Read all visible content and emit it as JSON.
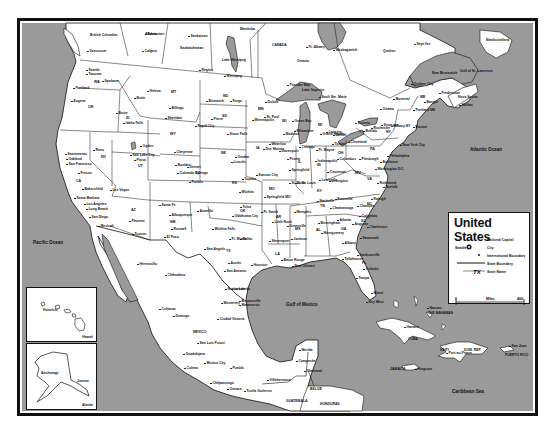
{
  "map": {
    "title": "United States",
    "colors": {
      "water": "#9a9a9a",
      "land": "#ffffff",
      "border": "#111111",
      "frame": "#111111"
    },
    "legend": {
      "title": "United States",
      "items": [
        {
          "symbol": "capital-star-icon",
          "label": "National Capital"
        },
        {
          "symbol": "city-dot-icon",
          "sample": "Seattle",
          "label": "City"
        },
        {
          "symbol": "international-boundary-line",
          "label": "International Boundary"
        },
        {
          "symbol": "state-boundary-line",
          "label": "State Boundary"
        },
        {
          "symbol": "state-abbr",
          "sample": "TX",
          "label": "State Name"
        }
      ],
      "scale": {
        "start": "0",
        "unit": "Miles",
        "end": "400"
      }
    },
    "water_labels": {
      "pacific": "Pacific Ocean",
      "atlantic": "Atlantic Ocean",
      "gulf": "Gulf of Mexico",
      "caribbean": "Caribbean Sea",
      "st_lawrence": "Gulf of St. Lawrence",
      "lake_winnipeg": "Lake Winnipeg",
      "lake_superior": "Lake Superior"
    },
    "insets": {
      "hawaii": {
        "caption": "Hawaii",
        "city": "Honolulu"
      },
      "alaska": {
        "caption": "Alaska",
        "cities": [
          "Anchorage",
          "Juneau"
        ]
      }
    },
    "regions": {
      "canada": "CANADA",
      "mexico": "MEXICO",
      "cuba": "CUBA",
      "haiti": "HAITI",
      "dom_rep": "DOM. REP.",
      "jamaica": "JAMAICA",
      "bahamas": "THE BAHAMAS",
      "puerto_rico": "PUERTO RICO",
      "belize": "BELIZE",
      "guatemala": "GUATEMALA",
      "honduras": "HONDURAS",
      "british_columbia": "British Columbia",
      "alberta": "Alberta",
      "saskatchewan": "Saskatchewan",
      "manitoba": "Manitoba",
      "ontario": "Ontario",
      "quebec": "Quebec",
      "newfoundland": "Newfoundland",
      "new_brunswick": "New Brunswick",
      "nova_scotia": "Nova Scotia"
    },
    "states": [
      "WA",
      "OR",
      "CA",
      "NV",
      "ID",
      "MT",
      "WY",
      "UT",
      "AZ",
      "NM",
      "CO",
      "ND",
      "SD",
      "NE",
      "KS",
      "OK",
      "TX",
      "MN",
      "IA",
      "MO",
      "AR",
      "LA",
      "WI",
      "IL",
      "MI",
      "IN",
      "OH",
      "KY",
      "TN",
      "MS",
      "AL",
      "GA",
      "FL",
      "SC",
      "NC",
      "VA",
      "WV",
      "PA",
      "NY",
      "ME"
    ],
    "cities": [
      {
        "name": "Vancouver",
        "x": 88,
        "y": 50
      },
      {
        "name": "Calgary",
        "x": 143,
        "y": 50
      },
      {
        "name": "Edmonton",
        "x": 146,
        "y": 33
      },
      {
        "name": "Saskatoon",
        "x": 189,
        "y": 35
      },
      {
        "name": "Regina",
        "x": 200,
        "y": 69
      },
      {
        "name": "Winnipeg",
        "x": 225,
        "y": 75
      },
      {
        "name": "Thunder Bay",
        "x": 288,
        "y": 84
      },
      {
        "name": "Ft. Albany",
        "x": 307,
        "y": 46
      },
      {
        "name": "Waskaganish",
        "x": 334,
        "y": 49
      },
      {
        "name": "Sept Iles",
        "x": 415,
        "y": 43
      },
      {
        "name": "Seattle",
        "x": 87,
        "y": 69
      },
      {
        "name": "Tacoma",
        "x": 87,
        "y": 73
      },
      {
        "name": "Spokane",
        "x": 103,
        "y": 80
      },
      {
        "name": "Portland",
        "x": 74,
        "y": 87
      },
      {
        "name": "Eugene",
        "x": 72,
        "y": 100
      },
      {
        "name": "Boise",
        "x": 117,
        "y": 112
      },
      {
        "name": "Idaho Falls",
        "x": 124,
        "y": 122
      },
      {
        "name": "Helena",
        "x": 148,
        "y": 90
      },
      {
        "name": "Butte",
        "x": 135,
        "y": 97
      },
      {
        "name": "Billings",
        "x": 170,
        "y": 107
      },
      {
        "name": "Sheridan",
        "x": 166,
        "y": 117
      },
      {
        "name": "Cheyenne",
        "x": 175,
        "y": 151
      },
      {
        "name": "Salt Lake City",
        "x": 131,
        "y": 154
      },
      {
        "name": "Ogden",
        "x": 141,
        "y": 145
      },
      {
        "name": "Provo",
        "x": 135,
        "y": 159
      },
      {
        "name": "Reno",
        "x": 94,
        "y": 149
      },
      {
        "name": "Sacramento",
        "x": 66,
        "y": 153
      },
      {
        "name": "Oakland",
        "x": 67,
        "y": 158
      },
      {
        "name": "San Francisco",
        "x": 67,
        "y": 163
      },
      {
        "name": "Fresno",
        "x": 79,
        "y": 172
      },
      {
        "name": "Bakersfield",
        "x": 83,
        "y": 188
      },
      {
        "name": "Las Vegas",
        "x": 111,
        "y": 189
      },
      {
        "name": "Santa Barbara",
        "x": 75,
        "y": 197
      },
      {
        "name": "Los Angeles",
        "x": 85,
        "y": 203
      },
      {
        "name": "Long Beach",
        "x": 87,
        "y": 208
      },
      {
        "name": "San Diego",
        "x": 90,
        "y": 216
      },
      {
        "name": "Mexicali",
        "x": 99,
        "y": 225
      },
      {
        "name": "Phoenix",
        "x": 130,
        "y": 220
      },
      {
        "name": "Tucson",
        "x": 133,
        "y": 233
      },
      {
        "name": "Boulder",
        "x": 176,
        "y": 164
      },
      {
        "name": "Denver",
        "x": 188,
        "y": 166
      },
      {
        "name": "Colorado Springs",
        "x": 178,
        "y": 172
      },
      {
        "name": "Pueblo",
        "x": 190,
        "y": 181
      },
      {
        "name": "Santa Fe",
        "x": 160,
        "y": 204
      },
      {
        "name": "Albuquerque",
        "x": 170,
        "y": 214
      },
      {
        "name": "Roswell",
        "x": 172,
        "y": 228
      },
      {
        "name": "El Paso",
        "x": 165,
        "y": 236
      },
      {
        "name": "Bismarck",
        "x": 207,
        "y": 100
      },
      {
        "name": "Fargo",
        "x": 231,
        "y": 100
      },
      {
        "name": "Pierre",
        "x": 212,
        "y": 118
      },
      {
        "name": "Rapid City",
        "x": 196,
        "y": 125
      },
      {
        "name": "Sioux Falls",
        "x": 228,
        "y": 133
      },
      {
        "name": "Omaha",
        "x": 236,
        "y": 156
      },
      {
        "name": "Lincoln",
        "x": 232,
        "y": 161
      },
      {
        "name": "Topeka",
        "x": 243,
        "y": 178
      },
      {
        "name": "Wichita",
        "x": 240,
        "y": 191
      },
      {
        "name": "Kansas City",
        "x": 257,
        "y": 174
      },
      {
        "name": "Amarillo",
        "x": 198,
        "y": 210
      },
      {
        "name": "Tulsa",
        "x": 241,
        "y": 206
      },
      {
        "name": "Oklahoma City",
        "x": 233,
        "y": 215
      },
      {
        "name": "Wichita Falls",
        "x": 213,
        "y": 228
      },
      {
        "name": "Ft. Worth",
        "x": 230,
        "y": 238
      },
      {
        "name": "Dallas",
        "x": 241,
        "y": 238
      },
      {
        "name": "San Angelo",
        "x": 205,
        "y": 248
      },
      {
        "name": "Austin",
        "x": 229,
        "y": 262
      },
      {
        "name": "San Antonio",
        "x": 225,
        "y": 270
      },
      {
        "name": "Houston",
        "x": 252,
        "y": 264
      },
      {
        "name": "Minneapolis",
        "x": 253,
        "y": 119
      },
      {
        "name": "St. Paul",
        "x": 265,
        "y": 116
      },
      {
        "name": "Duluth",
        "x": 266,
        "y": 101
      },
      {
        "name": "Des Moines",
        "x": 264,
        "y": 148
      },
      {
        "name": "Waterloo",
        "x": 270,
        "y": 143
      },
      {
        "name": "Davenport",
        "x": 280,
        "y": 150
      },
      {
        "name": "Madison",
        "x": 284,
        "y": 133
      },
      {
        "name": "Milwaukee",
        "x": 295,
        "y": 130
      },
      {
        "name": "Green Bay",
        "x": 293,
        "y": 120
      },
      {
        "name": "Chicago",
        "x": 300,
        "y": 146
      },
      {
        "name": "Peoria",
        "x": 288,
        "y": 158
      },
      {
        "name": "Springfield",
        "x": 290,
        "y": 169
      },
      {
        "name": "St. Louis",
        "x": 290,
        "y": 182
      },
      {
        "name": "E. St. Louis",
        "x": 296,
        "y": 182
      },
      {
        "name": "Springfield MO",
        "x": 265,
        "y": 196
      },
      {
        "name": "Ft. Smith",
        "x": 262,
        "y": 211
      },
      {
        "name": "Little Rock",
        "x": 273,
        "y": 221
      },
      {
        "name": "Shreveport",
        "x": 270,
        "y": 240
      },
      {
        "name": "Baton Rouge",
        "x": 282,
        "y": 259
      },
      {
        "name": "New Orleans",
        "x": 293,
        "y": 265
      },
      {
        "name": "Memphis",
        "x": 295,
        "y": 211
      },
      {
        "name": "Greenville",
        "x": 288,
        "y": 225
      },
      {
        "name": "Jackson",
        "x": 292,
        "y": 238
      },
      {
        "name": "Nashville",
        "x": 318,
        "y": 200
      },
      {
        "name": "Knoxville",
        "x": 336,
        "y": 198
      },
      {
        "name": "Chattanooga",
        "x": 331,
        "y": 207
      },
      {
        "name": "Birmingham",
        "x": 319,
        "y": 222
      },
      {
        "name": "Montgomery",
        "x": 322,
        "y": 232
      },
      {
        "name": "Atlanta",
        "x": 338,
        "y": 219
      },
      {
        "name": "Augusta",
        "x": 353,
        "y": 223
      },
      {
        "name": "Savannah",
        "x": 361,
        "y": 237
      },
      {
        "name": "Albany",
        "x": 343,
        "y": 242
      },
      {
        "name": "Jacksonville",
        "x": 358,
        "y": 254
      },
      {
        "name": "Tallahassee",
        "x": 343,
        "y": 258
      },
      {
        "name": "Orlando",
        "x": 364,
        "y": 268
      },
      {
        "name": "Tampa",
        "x": 357,
        "y": 277
      },
      {
        "name": "Miami",
        "x": 372,
        "y": 292
      },
      {
        "name": "Key West",
        "x": 367,
        "y": 301
      },
      {
        "name": "Charleston",
        "x": 368,
        "y": 226
      },
      {
        "name": "Columbia",
        "x": 360,
        "y": 215
      },
      {
        "name": "Charlotte",
        "x": 358,
        "y": 205
      },
      {
        "name": "Raleigh",
        "x": 372,
        "y": 198
      },
      {
        "name": "Norfolk",
        "x": 384,
        "y": 186
      },
      {
        "name": "Richmond",
        "x": 378,
        "y": 182
      },
      {
        "name": "Louisville",
        "x": 320,
        "y": 179
      },
      {
        "name": "Lexington",
        "x": 330,
        "y": 180
      },
      {
        "name": "Indianapolis",
        "x": 316,
        "y": 160
      },
      {
        "name": "Ft. Wayne",
        "x": 317,
        "y": 149
      },
      {
        "name": "Columbus",
        "x": 338,
        "y": 158
      },
      {
        "name": "Cincinnati",
        "x": 328,
        "y": 171
      },
      {
        "name": "Toledo",
        "x": 333,
        "y": 143
      },
      {
        "name": "Cleveland",
        "x": 349,
        "y": 141
      },
      {
        "name": "Detroit",
        "x": 334,
        "y": 134
      },
      {
        "name": "Lansing",
        "x": 327,
        "y": 131
      },
      {
        "name": "Grand Rapids",
        "x": 321,
        "y": 133
      },
      {
        "name": "Sault Ste. Marie",
        "x": 320,
        "y": 96
      },
      {
        "name": "Toronto",
        "x": 356,
        "y": 122
      },
      {
        "name": "Ottawa",
        "x": 381,
        "y": 108
      },
      {
        "name": "Montreal",
        "x": 394,
        "y": 98
      },
      {
        "name": "Quebec City",
        "x": 412,
        "y": 83
      },
      {
        "name": "Pittsburgh",
        "x": 360,
        "y": 158
      },
      {
        "name": "Buffalo",
        "x": 364,
        "y": 130
      },
      {
        "name": "Rochester",
        "x": 372,
        "y": 127
      },
      {
        "name": "Syracuse",
        "x": 382,
        "y": 124
      },
      {
        "name": "Albany NY",
        "x": 392,
        "y": 125
      },
      {
        "name": "Philadelphia",
        "x": 388,
        "y": 155
      },
      {
        "name": "Baltimore",
        "x": 381,
        "y": 161
      },
      {
        "name": "Washington D.C.",
        "x": 376,
        "y": 168
      },
      {
        "name": "New York City",
        "x": 401,
        "y": 144
      },
      {
        "name": "Boston",
        "x": 414,
        "y": 126
      },
      {
        "name": "Portland ME",
        "x": 414,
        "y": 109
      },
      {
        "name": "Bangor",
        "x": 425,
        "y": 101
      },
      {
        "name": "Fredericton",
        "x": 440,
        "y": 92
      },
      {
        "name": "Halifax",
        "x": 460,
        "y": 104
      },
      {
        "name": "Monterrey",
        "x": 222,
        "y": 302
      },
      {
        "name": "Nuevo Laredo",
        "x": 226,
        "y": 288
      },
      {
        "name": "Laredo",
        "x": 232,
        "y": 288
      },
      {
        "name": "Brownsville",
        "x": 240,
        "y": 300
      },
      {
        "name": "Matamoros",
        "x": 240,
        "y": 304
      },
      {
        "name": "Ciudad Victoria",
        "x": 218,
        "y": 318
      },
      {
        "name": "Chihuahua",
        "x": 166,
        "y": 274
      },
      {
        "name": "Hermosillo",
        "x": 138,
        "y": 263
      },
      {
        "name": "Culiacan",
        "x": 160,
        "y": 308
      },
      {
        "name": "Durango",
        "x": 174,
        "y": 315
      },
      {
        "name": "San Luis Potosi",
        "x": 198,
        "y": 342
      },
      {
        "name": "Guadalajara",
        "x": 184,
        "y": 353
      },
      {
        "name": "Colima",
        "x": 185,
        "y": 367
      },
      {
        "name": "Mexico City",
        "x": 205,
        "y": 362
      },
      {
        "name": "Puebla",
        "x": 231,
        "y": 367
      },
      {
        "name": "Chilpancingo",
        "x": 211,
        "y": 382
      },
      {
        "name": "Oaxaca",
        "x": 228,
        "y": 388
      },
      {
        "name": "Tuxtla Gutierrez",
        "x": 245,
        "y": 390
      },
      {
        "name": "Villahermosa",
        "x": 268,
        "y": 379
      },
      {
        "name": "Merida",
        "x": 300,
        "y": 349
      },
      {
        "name": "Campeche",
        "x": 297,
        "y": 360
      },
      {
        "name": "Chetumal",
        "x": 305,
        "y": 370
      },
      {
        "name": "Havana",
        "x": 405,
        "y": 326
      },
      {
        "name": "Nassau",
        "x": 428,
        "y": 307
      },
      {
        "name": "Port-au-Prince",
        "x": 447,
        "y": 352
      },
      {
        "name": "San Juan",
        "x": 510,
        "y": 345
      },
      {
        "name": "Kingston",
        "x": 416,
        "y": 368
      }
    ]
  }
}
